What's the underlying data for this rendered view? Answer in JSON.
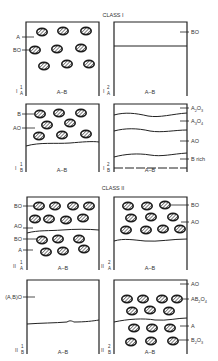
{
  "diagram": {
    "class_labels": {
      "class1": "CLASS I",
      "class2": "CLASS II"
    },
    "axis_label": "A–B",
    "panels": [
      {
        "id": "I-1-A",
        "roman": "I",
        "sup": "1",
        "sub": "A",
        "labels": [
          "A",
          "BO"
        ],
        "description": "Particles of BO dispersed in A matrix"
      },
      {
        "id": "I-2-A",
        "roman": "I",
        "sup": "2",
        "sub": "A",
        "labels": [
          "BO"
        ],
        "description": "Continuous BO surface layer"
      },
      {
        "id": "I-1-B",
        "roman": "I",
        "sup": "1",
        "sub": "B",
        "labels": [
          "B",
          "AO"
        ],
        "description": "AO particles in B matrix above interface"
      },
      {
        "id": "I-2-B",
        "roman": "I",
        "sup": "2",
        "sub": "B",
        "labels": [
          "A2O3",
          "A3O4",
          "AO",
          "B rich"
        ],
        "label_parts": [
          {
            "base": "A",
            "s1": "2",
            "mid": "O",
            "s2": "3"
          },
          {
            "base": "A",
            "s1": "3",
            "mid": "O",
            "s2": "4"
          },
          {
            "base": "AO"
          },
          {
            "base": "B rich"
          }
        ],
        "description": "Layered oxide scale"
      },
      {
        "id": "II-1-A",
        "roman": "II",
        "sup": "1",
        "sub": "A",
        "labels": [
          "BO",
          "AO",
          "BO",
          "A"
        ],
        "description": "BO particles in AO outer scale, BO internal oxide in A"
      },
      {
        "id": "II-2-A",
        "roman": "II",
        "sup": "2",
        "sub": "A",
        "labels": [
          "BO",
          "AO"
        ],
        "description": "BO particles in AO scale"
      },
      {
        "id": "II-1-B",
        "roman": "II",
        "sup": "1",
        "sub": "B",
        "labels": [
          "(A,B)O"
        ],
        "description": "Single-phase (A,B)O solid solution scale"
      },
      {
        "id": "II-2-B",
        "roman": "II",
        "sup": "2",
        "sub": "B",
        "labels": [
          "AO",
          "AB2O4",
          "A",
          "B2O3"
        ],
        "label_parts": [
          {
            "base": "AO"
          },
          {
            "base": "AB",
            "s1": "2",
            "mid": "O",
            "s2": "4"
          },
          {
            "base": "A"
          },
          {
            "base": "B",
            "s1": "2",
            "mid": "O",
            "s2": "3"
          }
        ],
        "description": "AB2O4 spinel particles in AO, B2O3 internal oxide in A"
      }
    ]
  }
}
